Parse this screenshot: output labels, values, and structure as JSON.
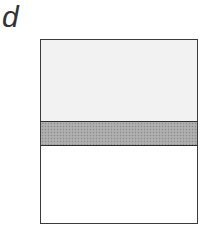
{
  "panel": {
    "label": "d"
  },
  "diagram": {
    "type": "layered-box",
    "layers": [
      {
        "name": "top",
        "fill": "#f2f2f2",
        "relative_height": 0.44
      },
      {
        "name": "middle",
        "fill": "#a9a9a9",
        "pattern": "stippled",
        "relative_height": 0.14
      },
      {
        "name": "bottom",
        "fill": "#ffffff",
        "relative_height": 0.42
      }
    ],
    "border_color": "#3a3a3a"
  }
}
